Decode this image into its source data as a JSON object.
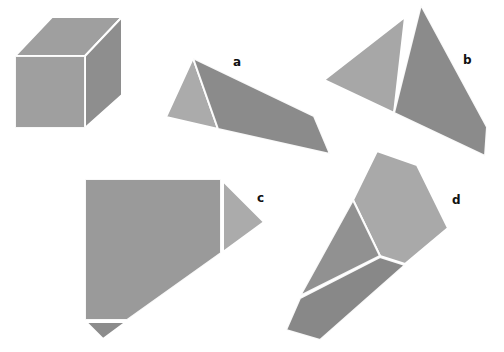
{
  "diagram": {
    "colors": {
      "background": "#ffffff",
      "light_face": "#a9a9a9",
      "mid_face": "#9a9a9a",
      "dark_face": "#8c8c8c",
      "edge": "#ffffff",
      "label": "#111111"
    },
    "figures": [
      {
        "id": "cube",
        "label": ""
      },
      {
        "id": "a",
        "label": "a"
      },
      {
        "id": "b",
        "label": "b"
      },
      {
        "id": "c",
        "label": "c"
      },
      {
        "id": "d",
        "label": "d"
      }
    ]
  }
}
